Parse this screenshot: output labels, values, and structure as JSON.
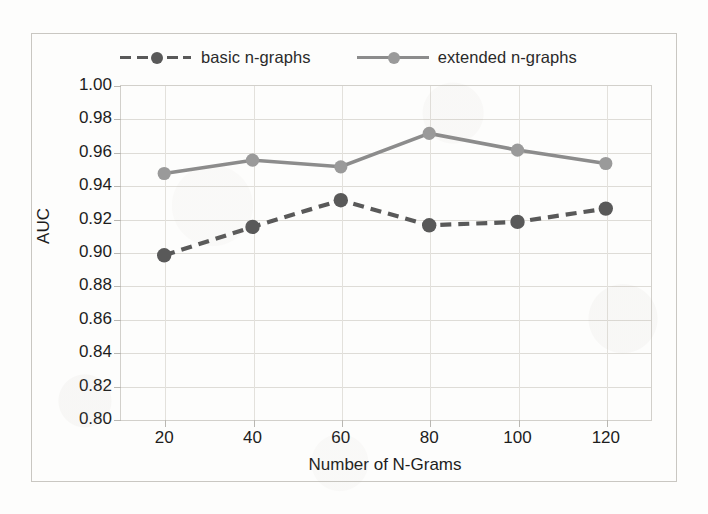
{
  "figure": {
    "background_color": "#fdfdfc",
    "frame_color": "#c9c7c2"
  },
  "legend": {
    "position": "top",
    "entries": [
      {
        "label": "basic n-graphs",
        "color": "#595959",
        "style": "dashed",
        "marker": "circle"
      },
      {
        "label": "extended n-graphs",
        "color": "#8c8c8c",
        "style": "solid",
        "marker": "circle"
      }
    ]
  },
  "axes": {
    "y_label": "AUC",
    "x_label": "Number of N-Grams",
    "y_ticks": [
      "1.00",
      "0.98",
      "0.96",
      "0.94",
      "0.92",
      "0.90",
      "0.88",
      "0.86",
      "0.84",
      "0.82",
      "0.80"
    ],
    "x_ticks": [
      "20",
      "40",
      "60",
      "80",
      "100",
      "120"
    ]
  },
  "chart_data": {
    "type": "line",
    "title": "",
    "xlabel": "Number of N-Grams",
    "ylabel": "AUC",
    "x": [
      20,
      40,
      60,
      80,
      100,
      120
    ],
    "xlim": [
      10,
      130
    ],
    "ylim": [
      0.8,
      1.0
    ],
    "ytick_step": 0.02,
    "grid": true,
    "legend_position": "top",
    "series": [
      {
        "name": "basic n-graphs",
        "values": [
          0.898,
          0.915,
          0.931,
          0.916,
          0.918,
          0.926
        ],
        "color": "#595959",
        "linestyle": "dashed",
        "marker": "circle"
      },
      {
        "name": "extended n-graphs",
        "values": [
          0.947,
          0.955,
          0.951,
          0.971,
          0.961,
          0.953
        ],
        "color": "#8c8c8c",
        "linestyle": "solid",
        "marker": "circle"
      }
    ]
  }
}
